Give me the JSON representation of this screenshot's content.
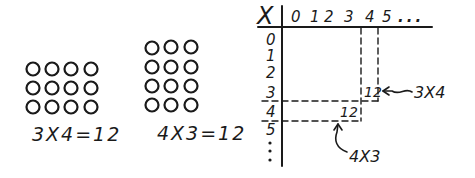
{
  "left_array": {
    "rows": 3,
    "cols": 4,
    "equation": "3X4=12"
  },
  "right_array": {
    "rows": 4,
    "cols": 3,
    "equation": "4X3=12"
  },
  "table": {
    "corner_symbol": "X",
    "column_labels": [
      "0",
      "1",
      "2",
      "3",
      "4",
      "5",
      "..."
    ],
    "row_labels": [
      "0",
      "1",
      "2",
      "3",
      "4",
      "5",
      ":"
    ],
    "cells": [
      {
        "row": "3",
        "col": "4",
        "value": "12",
        "annotation": "3X4"
      },
      {
        "row": "4",
        "col": "3",
        "value": "12",
        "annotation": "4X3"
      }
    ]
  },
  "colors": {
    "ink": "#1a1a1a",
    "background": "#ffffff"
  }
}
